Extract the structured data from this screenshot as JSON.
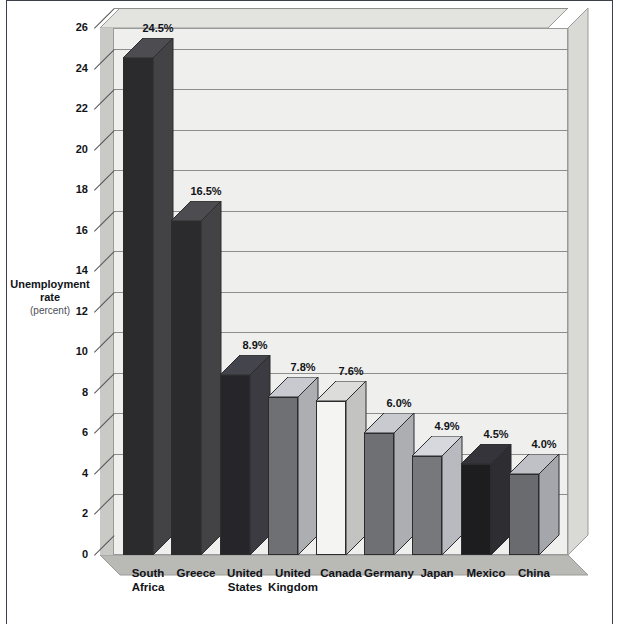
{
  "chart_data": {
    "type": "bar",
    "title": "",
    "xlabel": "",
    "ylabel": "Unemployment rate (percent)",
    "ylabel_lines": [
      "Unemployment",
      "rate",
      "(percent)"
    ],
    "ylim": [
      0,
      26
    ],
    "ytick_step": 2,
    "yticks": [
      26,
      24,
      22,
      20,
      18,
      16,
      14,
      12,
      10,
      8,
      6,
      4,
      2,
      0
    ],
    "grid": true,
    "legend": "none",
    "style": "3d-bar",
    "categories": [
      "South\nAfrica",
      "Greece",
      "United\nStates",
      "United\nKingdom",
      "Canada",
      "Germany",
      "Japan",
      "Mexico",
      "China"
    ],
    "values": [
      24.5,
      16.5,
      8.9,
      7.8,
      7.6,
      6.0,
      4.9,
      4.5,
      4.0
    ],
    "data_labels": [
      "24.5%",
      "16.5%",
      "8.9%",
      "7.8%",
      "7.6%",
      "6.0%",
      "4.9%",
      "4.5%",
      "4.0%"
    ],
    "bar_colors": [
      "#2b2b2d",
      "#2b2b2d",
      "#26262a",
      "#6f7073",
      "#f4f4f2",
      "#6f7073",
      "#77787b",
      "#1d1d20",
      "#6a6b6e"
    ]
  },
  "colors": {
    "panel": "#efefed",
    "panel_edge": "#9a9a98",
    "gridline": "#8d8d8b",
    "wall_shade": "#c9c9c6",
    "floor": "#b9b9b6",
    "text": "#111318",
    "frame": "#3a3f4a"
  }
}
